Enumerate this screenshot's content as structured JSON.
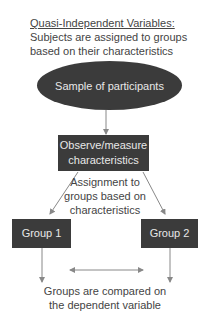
{
  "header": {
    "title": "Quasi-Independent Variables:",
    "subtitle_line1": "Subjects are assigned to groups",
    "subtitle_line2": "based on their characteristics"
  },
  "nodes": {
    "sample": "Sample of participants",
    "observe_line1": "Observe/measure",
    "observe_line2": "characteristics",
    "group1": "Group 1",
    "group2": "Group 2"
  },
  "labels": {
    "assignment_line1": "Assignment to",
    "assignment_line2": "groups based on",
    "assignment_line3": "characteristics",
    "compare_line1": "Groups are compared on",
    "compare_line2": "the dependent variable"
  },
  "colors": {
    "node_fill": "#3b3b3b",
    "node_text": "#e8e8e8",
    "arrow": "#888888"
  }
}
